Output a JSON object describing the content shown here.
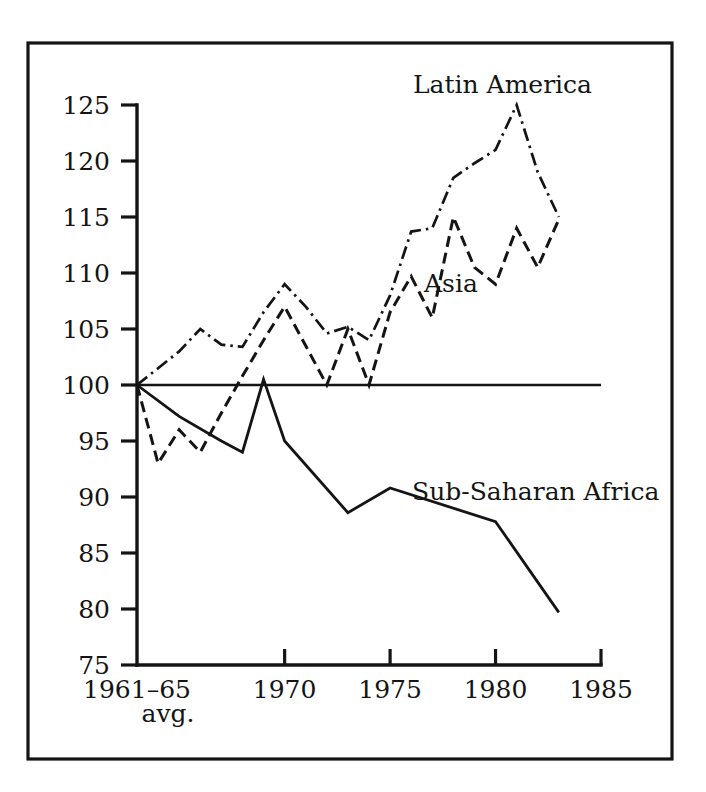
{
  "figure": {
    "frame": {
      "visible": true,
      "color": "#141414"
    },
    "background_color": "#ffffff",
    "ink_color": "#141414"
  },
  "axes": {
    "y_tick_labels": [
      "125",
      "120",
      "115",
      "110",
      "105",
      "100",
      "95",
      "90",
      "85",
      "80",
      "75"
    ],
    "x_tick_labels": [
      "1961–65",
      "1970",
      "1975",
      "1980",
      "1985"
    ],
    "x_axis_sublabel": "avg.",
    "baseline_label": "100"
  },
  "series_labels": {
    "latin_america": "Latin America",
    "asia": "Asia",
    "africa": "Sub-Saharan Africa"
  },
  "chart_data": {
    "type": "line",
    "title": "",
    "subtitle": "",
    "xlabel": "",
    "ylabel": "",
    "xlim": [
      1963,
      1985
    ],
    "ylim": [
      75,
      125
    ],
    "y_ticks": [
      75,
      80,
      85,
      90,
      95,
      100,
      105,
      110,
      115,
      120,
      125
    ],
    "x_ticks": [
      1963,
      1970,
      1975,
      1980,
      1985
    ],
    "x_tick_labels": [
      "1961–65 avg.",
      "1970",
      "1975",
      "1980",
      "1985"
    ],
    "grid": false,
    "legend": "inline-annotations",
    "reference_line": {
      "y": 100,
      "style": "solid",
      "from_x": 1963,
      "to_x": 1985
    },
    "note": "Index of per capita food production, 1961–65 average = 100",
    "series": [
      {
        "name": "Latin America",
        "line_style": "dash-dot",
        "x": [
          1963,
          1964,
          1965,
          1966,
          1967,
          1968,
          1969,
          1970,
          1971,
          1972,
          1973,
          1974,
          1975,
          1976,
          1977,
          1978,
          1979,
          1980,
          1981,
          1982,
          1983
        ],
        "values": [
          100.0,
          101.5,
          103.0,
          105.0,
          103.6,
          103.4,
          106.5,
          109.0,
          107.0,
          104.6,
          105.2,
          104.0,
          108.0,
          113.7,
          114.0,
          118.5,
          119.8,
          121.0,
          125.0,
          119.0,
          115.0
        ]
      },
      {
        "name": "Asia",
        "line_style": "dashed",
        "x": [
          1963,
          1964,
          1965,
          1966,
          1967,
          1968,
          1969,
          1970,
          1971,
          1972,
          1973,
          1974,
          1975,
          1976,
          1977,
          1978,
          1979,
          1980,
          1981,
          1982,
          1983
        ],
        "values": [
          100.0,
          93.0,
          96.0,
          94.0,
          97.5,
          100.8,
          104.0,
          107.0,
          103.5,
          100.0,
          105.0,
          100.0,
          106.5,
          109.7,
          106.0,
          115.0,
          110.5,
          109.0,
          114.0,
          110.5,
          114.8
        ]
      },
      {
        "name": "Sub-Saharan Africa",
        "line_style": "solid",
        "x": [
          1963,
          1965,
          1967,
          1968,
          1969,
          1970,
          1973,
          1975,
          1980,
          1983
        ],
        "values": [
          100.0,
          97.2,
          95.0,
          94.0,
          100.5,
          95.0,
          88.6,
          90.8,
          87.8,
          79.7
        ]
      }
    ]
  }
}
